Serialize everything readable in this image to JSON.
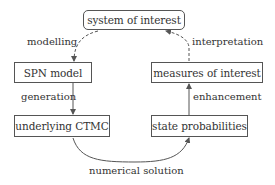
{
  "nodes": {
    "system": "system of interest",
    "spn": "SPN model",
    "measures": "measures of interest",
    "ctmc": "underlying CTMC",
    "stateprob": "state probabilities"
  },
  "edges": {
    "modelling": "modelling",
    "interpretation": "interpretation",
    "generation": "generation",
    "enhancement": "enhancement",
    "numerical": "numerical solution"
  },
  "colors": {
    "line": "#555555",
    "text": "#333333"
  }
}
